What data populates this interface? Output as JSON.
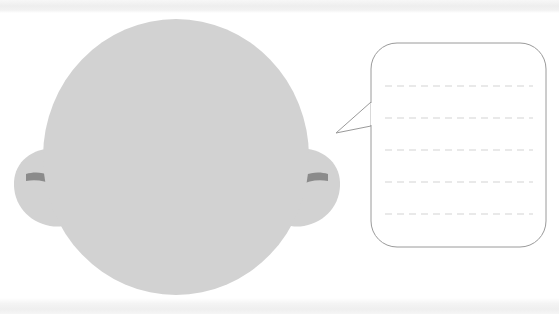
{
  "canvas": {
    "width": 559,
    "height": 314,
    "background_color": "#ffffff",
    "title": "Bald head with blank speech bubble"
  },
  "bands": {
    "top": {
      "label": "top scan band",
      "color": "#efefef",
      "height": 13
    },
    "bottom": {
      "label": "bottom scan band",
      "color": "#f0f0f0",
      "height": 16
    }
  },
  "head": {
    "label": "Head",
    "fill_color": "#d2d2d2",
    "center_x": 176,
    "center_y": 157,
    "radius_x": 133,
    "radius_y": 138
  },
  "ears": [
    {
      "label": "Left ear",
      "side": "left",
      "fill_color": "#d2d2d2",
      "inner_stroke_color": "#8f8f8f",
      "center_x": 40,
      "center_y": 188
    },
    {
      "label": "Right ear",
      "side": "right",
      "fill_color": "#d2d2d2",
      "inner_stroke_color": "#8f8f8f",
      "center_x": 314,
      "center_y": 188
    }
  ],
  "speech_bubble": {
    "label": "Speech bubble",
    "text": "",
    "placeholder": "",
    "fill_color": "#ffffff",
    "stroke_color": "#9a9a9a",
    "stroke_width": 1,
    "corner_radius": 26,
    "box": {
      "x": 371,
      "y": 43,
      "width": 175,
      "height": 204
    },
    "tail": {
      "label": "Speech bubble tail",
      "tip_x": 336,
      "tip_y": 133,
      "top_x": 371,
      "top_y": 102,
      "bottom_x": 371,
      "bottom_y": 126
    },
    "writing_lines": {
      "label": "Writing lines",
      "color": "#e2e2e2",
      "dash": "7 5",
      "x_start": 385,
      "x_end": 533,
      "y_positions": [
        86,
        118,
        150,
        182,
        214
      ]
    }
  }
}
